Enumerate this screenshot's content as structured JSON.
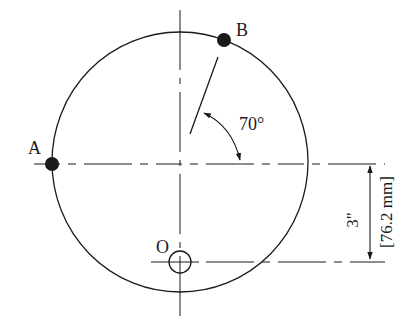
{
  "diagram": {
    "points": [
      {
        "id": "A",
        "label": "A"
      },
      {
        "id": "B",
        "label": "B"
      },
      {
        "id": "O",
        "label": "O"
      }
    ],
    "angle": {
      "label": "70°",
      "value_deg": 70
    },
    "dimension": {
      "imperial": "3\"",
      "metric": "[76.2 mm]"
    },
    "colors": {
      "stroke": "#1a1a1a",
      "background": "#ffffff"
    }
  }
}
